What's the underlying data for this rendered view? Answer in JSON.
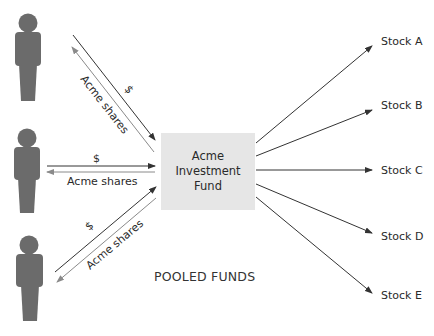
{
  "diagram": {
    "fund_box": {
      "line1": "Acme",
      "line2": "Investment",
      "line3": "Fund",
      "fill": "#e6e6e6"
    },
    "caption": "POOLED FUNDS",
    "investors": [
      {
        "money_label": "$",
        "shares_label": "Acme shares"
      },
      {
        "money_label": "$",
        "shares_label": "Acme shares"
      },
      {
        "money_label": "$",
        "shares_label": "Acme shares"
      }
    ],
    "stocks": [
      {
        "label": "Stock A"
      },
      {
        "label": "Stock B"
      },
      {
        "label": "Stock C"
      },
      {
        "label": "Stock D"
      },
      {
        "label": "Stock E"
      }
    ],
    "colors": {
      "person": "#6b6b6b",
      "money_arrow": "#333333",
      "shares_arrow": "#8a8a8a",
      "stock_arrow": "#333333"
    }
  }
}
